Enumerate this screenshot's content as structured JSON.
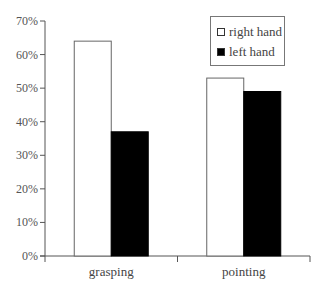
{
  "chart_data": {
    "type": "bar",
    "title": "",
    "xlabel": "",
    "ylabel": "",
    "categories": [
      "grasping",
      "pointing"
    ],
    "series": [
      {
        "name": "right hand",
        "values": [
          64,
          53
        ],
        "color": "#ffffff"
      },
      {
        "name": "left hand",
        "values": [
          37,
          49
        ],
        "color": "#000000"
      }
    ],
    "ylim": [
      0,
      70
    ],
    "yticks": [
      "0%",
      "10%",
      "20%",
      "30%",
      "40%",
      "50%",
      "60%",
      "70%"
    ],
    "grid": false,
    "legend_position": "upper right"
  },
  "legend": {
    "items": [
      {
        "label": "right hand",
        "color": "#ffffff"
      },
      {
        "label": "left hand",
        "color": "#000000"
      }
    ]
  }
}
